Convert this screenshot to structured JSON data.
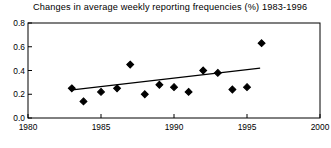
{
  "chart_data": {
    "type": "scatter",
    "title": "Changes in average weekly reporting frequencies (%) 1983-1996",
    "xlabel": "",
    "ylabel": "",
    "xlim": [
      1980,
      2000
    ],
    "ylim": [
      0.0,
      0.8
    ],
    "grid": false,
    "legend": null,
    "xticks": [
      1980,
      1985,
      1990,
      1995,
      2000
    ],
    "xtick_labels": [
      "1980",
      "1985",
      "1990",
      "1995",
      "2000"
    ],
    "yticks": [
      0.0,
      0.2,
      0.4,
      0.6,
      0.8
    ],
    "ytick_labels": [
      "0.0",
      "0.2",
      "0.4",
      "0.6",
      "0.8"
    ],
    "marker": "diamond",
    "marker_color": "#000000",
    "x": [
      1983.0,
      1983.8,
      1985.0,
      1986.1,
      1987.0,
      1988.0,
      1989.0,
      1990.0,
      1991.0,
      1992.0,
      1993.0,
      1994.0,
      1995.0,
      1996.0
    ],
    "y": [
      0.25,
      0.14,
      0.22,
      0.25,
      0.45,
      0.2,
      0.28,
      0.26,
      0.22,
      0.4,
      0.38,
      0.24,
      0.26,
      0.63
    ],
    "points": [
      {
        "x": 1983.0,
        "y": 0.25
      },
      {
        "x": 1983.8,
        "y": 0.14
      },
      {
        "x": 1985.0,
        "y": 0.22
      },
      {
        "x": 1986.1,
        "y": 0.25
      },
      {
        "x": 1987.0,
        "y": 0.45
      },
      {
        "x": 1988.0,
        "y": 0.2
      },
      {
        "x": 1989.0,
        "y": 0.28
      },
      {
        "x": 1990.0,
        "y": 0.26
      },
      {
        "x": 1991.0,
        "y": 0.22
      },
      {
        "x": 1992.0,
        "y": 0.4
      },
      {
        "x": 1993.0,
        "y": 0.38
      },
      {
        "x": 1994.0,
        "y": 0.24
      },
      {
        "x": 1995.0,
        "y": 0.26
      },
      {
        "x": 1996.0,
        "y": 0.63
      }
    ],
    "trendline": {
      "type": "line",
      "color": "#000000",
      "x": [
        1982.9,
        1995.9
      ],
      "y": [
        0.235,
        0.42
      ]
    }
  },
  "axes": {
    "frame_color": "#000000",
    "background": "#ffffff"
  }
}
